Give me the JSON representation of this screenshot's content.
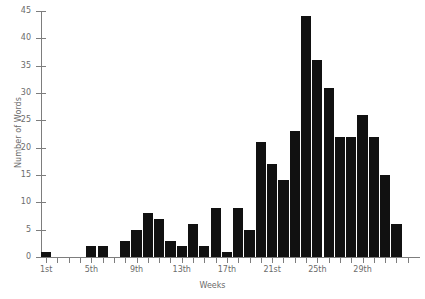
{
  "chart_data": {
    "type": "bar",
    "title": "",
    "xlabel": "Weeks",
    "ylabel": "Number of Words",
    "ylim": [
      0,
      45
    ],
    "ytick_step": 5,
    "yticks": [
      0,
      5,
      10,
      15,
      20,
      25,
      30,
      35,
      40,
      45
    ],
    "grid": false,
    "legend": null,
    "bar_color": "#111111",
    "axis_color": "#7d7d7d",
    "text_color": "#6b6b6b",
    "categories": [
      "1st",
      "2nd",
      "3rd",
      "4th",
      "5th",
      "6th",
      "7th",
      "8th",
      "9th",
      "10th",
      "11th",
      "12th",
      "13th",
      "14th",
      "15th",
      "16th",
      "17th",
      "18th",
      "19th",
      "20th",
      "21st",
      "22nd",
      "23rd",
      "24th",
      "25th",
      "26th",
      "27th",
      "28th",
      "29th",
      "30th",
      "31st",
      "32nd",
      "33rd"
    ],
    "values": [
      1,
      0,
      0,
      0,
      2,
      2,
      0,
      3,
      5,
      8,
      7,
      3,
      2,
      6,
      2,
      9,
      1,
      9,
      5,
      21,
      17,
      14,
      23,
      44,
      36,
      31,
      22,
      22,
      26,
      22,
      15,
      6,
      0
    ],
    "xtick_labels": [
      "1st",
      "5th",
      "9th",
      "13th",
      "17th",
      "21st",
      "25th",
      "29th"
    ],
    "xtick_indices": [
      0,
      4,
      8,
      12,
      16,
      20,
      24,
      28
    ]
  }
}
